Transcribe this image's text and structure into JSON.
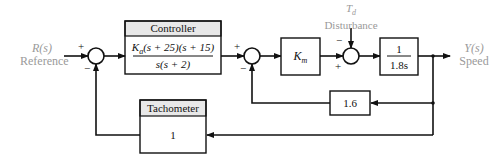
{
  "diagram": {
    "type": "block-diagram",
    "input": {
      "signal": "R(s)",
      "label": "Reference"
    },
    "output": {
      "signal": "Y(s)",
      "label": "Speed"
    },
    "disturbance": {
      "signal": "T",
      "subscript": "d",
      "label": "Disturbance"
    },
    "controller": {
      "title": "Controller",
      "numerator": "K",
      "numerator_sub": "a",
      "numerator_rest": "(s + 25)(s + 15)",
      "denominator": "s(s + 2)"
    },
    "motor_gain": {
      "symbol": "K",
      "subscript": "m"
    },
    "plant": {
      "numerator": "1",
      "denominator": "1.8s"
    },
    "inner_feedback": {
      "gain": "1.6"
    },
    "tachometer": {
      "title": "Tachometer",
      "gain": "1"
    },
    "summing_junctions": [
      {
        "id": "sum1",
        "signs": {
          "top": "+",
          "bottom": "−"
        }
      },
      {
        "id": "sum2",
        "signs": {
          "top": "+",
          "bottom": "−"
        }
      },
      {
        "id": "sum3",
        "signs": {
          "top": "−",
          "bottom": "+"
        }
      }
    ]
  },
  "colors": {
    "line": "#111111",
    "label_grey": "#9a9a9a",
    "header_fill": "#e8e8e8"
  }
}
